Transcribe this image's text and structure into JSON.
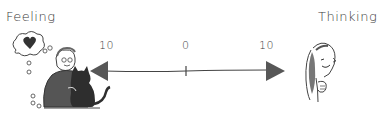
{
  "diagram": {
    "left_pole": {
      "label": "Feeling",
      "illustration": "man-hugging-cat-with-heart-thought-bubble"
    },
    "right_pole": {
      "label": "Thinking",
      "illustration": "woman-thinking-hand-on-chin"
    },
    "scale": {
      "ticks": [
        {
          "label": "10",
          "position": "left"
        },
        {
          "label": "0",
          "position": "center"
        },
        {
          "label": "10",
          "position": "right"
        }
      ],
      "arrow_color": "#575757",
      "line_color": "#444444"
    }
  }
}
